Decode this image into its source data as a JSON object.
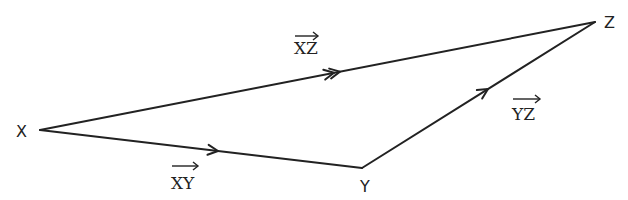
{
  "diagram": {
    "type": "vector triangle",
    "stroke_color": "#222222",
    "background": "#ffffff",
    "vertices": [
      {
        "id": "X",
        "label": "X",
        "x": 40,
        "y": 130
      },
      {
        "id": "Y",
        "label": "Y",
        "x": 362,
        "y": 168
      },
      {
        "id": "Z",
        "label": "Z",
        "x": 595,
        "y": 22
      }
    ],
    "edges": [
      {
        "from": "X",
        "to": "Y",
        "label": "XY",
        "arrow": "single",
        "vector": true
      },
      {
        "from": "Y",
        "to": "Z",
        "label": "YZ",
        "arrow": "single",
        "vector": true
      },
      {
        "from": "X",
        "to": "Z",
        "label": "XZ",
        "arrow": "double",
        "vector": true
      }
    ]
  }
}
